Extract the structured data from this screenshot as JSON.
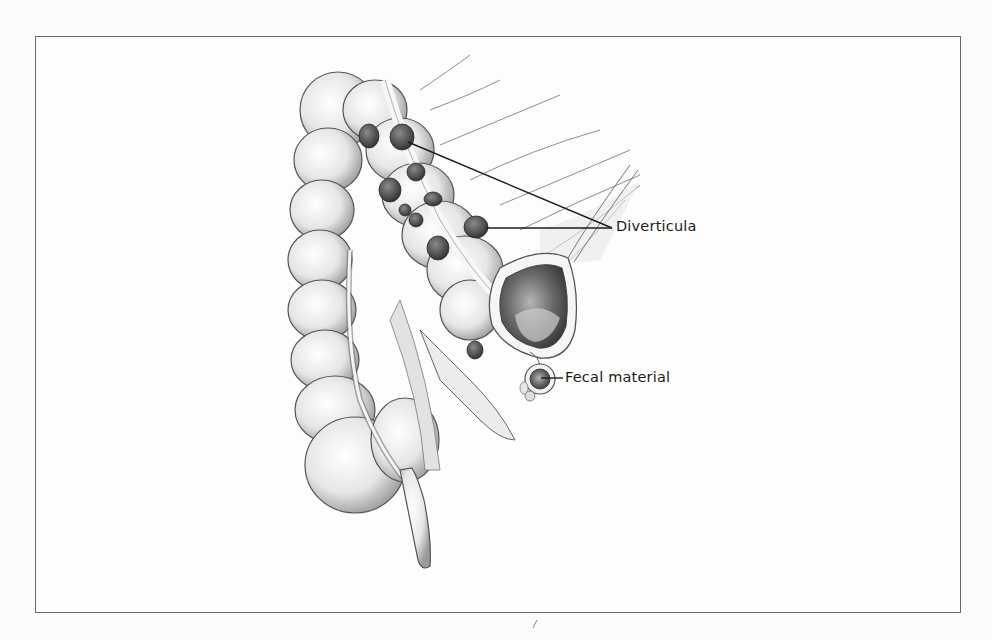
{
  "figure": {
    "labels": {
      "diverticula": "Diverticula",
      "fecal_material": "Fecal material"
    },
    "colors": {
      "frame": "#6a6a6a",
      "ink": "#1c1c1c",
      "paper": "#fbfbfa",
      "shading_dark": "#4a4a4a",
      "shading_mid": "#9a9a9a"
    }
  }
}
